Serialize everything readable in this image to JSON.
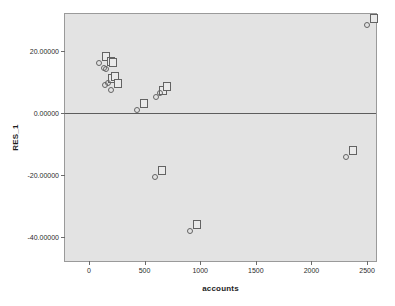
{
  "chart_data": {
    "type": "scatter",
    "title": "",
    "xlabel": "accounts",
    "ylabel": "RES_1",
    "xlim": [
      -215,
      2580
    ],
    "ylim": [
      -47.7,
      31.9
    ],
    "grid": false,
    "legend": false,
    "reference_lines": [
      {
        "axis": "y",
        "value": 0,
        "color": "#5d5d5d"
      }
    ],
    "xticks": [
      0,
      500,
      1000,
      1500,
      2000,
      2500
    ],
    "xtick_labels": [
      "0",
      "500",
      "1000",
      "1500",
      "2000",
      "2500"
    ],
    "yticks": [
      20,
      0,
      -20,
      -40
    ],
    "ytick_labels": [
      "20.00000",
      "0.00000",
      "-20.00000",
      "-40.00000"
    ],
    "marker": "circle-open",
    "marker_color": "#636363",
    "point_labels_shown": true,
    "points": [
      {
        "x": 95,
        "y": 16.0,
        "label": ""
      },
      {
        "x": 133,
        "y": 14.6,
        "label": ""
      },
      {
        "x": 152,
        "y": 14.2,
        "label": ""
      },
      {
        "x": 140,
        "y": 9.1,
        "label": ""
      },
      {
        "x": 168,
        "y": 9.6,
        "label": ""
      },
      {
        "x": 196,
        "y": 7.4,
        "label": ""
      },
      {
        "x": 432,
        "y": 1.0,
        "label": ""
      },
      {
        "x": 600,
        "y": 5.0,
        "label": ""
      },
      {
        "x": 640,
        "y": 6.6,
        "label": ""
      },
      {
        "x": 590,
        "y": -20.6,
        "label": ""
      },
      {
        "x": 905,
        "y": -38.0,
        "label": ""
      },
      {
        "x": 2310,
        "y": -14.3,
        "label": ""
      },
      {
        "x": 2500,
        "y": 28.3,
        "label": ""
      }
    ]
  },
  "panel": {
    "background_color": "#e3e3e3",
    "border_color": "#9a9a9a"
  }
}
